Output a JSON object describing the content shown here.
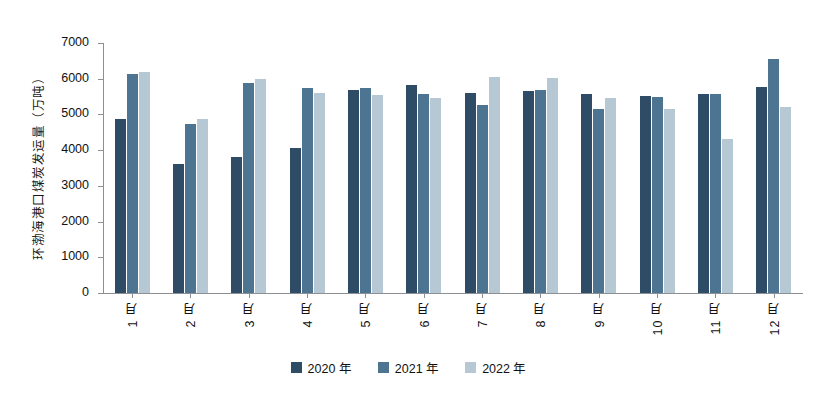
{
  "chart_data": {
    "type": "bar",
    "title": "",
    "xlabel": "",
    "ylabel": "环渤海港口煤炭发运量（万吨）",
    "ylim": [
      0,
      7000
    ],
    "yticks": [
      0,
      1000,
      2000,
      3000,
      4000,
      5000,
      6000,
      7000
    ],
    "ytick_labels": [
      "0",
      "1000",
      "2000",
      "3000",
      "4000",
      "5000",
      "6000",
      "7000"
    ],
    "grid": false,
    "legend_position": "bottom",
    "categories": [
      "1 月",
      "2 月",
      "3 月",
      "4 月",
      "5 月",
      "6 月",
      "7 月",
      "8 月",
      "9 月",
      "10 月",
      "11 月",
      "12 月"
    ],
    "series": [
      {
        "name": "2020 年",
        "color": "#2f4c66",
        "values": [
          4860,
          3600,
          3810,
          4070,
          5690,
          5830,
          5610,
          5650,
          5560,
          5520,
          5580,
          5770
        ]
      },
      {
        "name": "2021 年",
        "color": "#4d7490",
        "values": [
          6140,
          4720,
          5890,
          5750,
          5750,
          5570,
          5260,
          5690,
          5150,
          5500,
          5580,
          6540
        ]
      },
      {
        "name": "2022 年",
        "color": "#b7c8d5",
        "values": [
          6180,
          4860,
          6000,
          5610,
          5540,
          5470,
          6040,
          6030,
          5460,
          5150,
          4320,
          5210
        ]
      }
    ]
  },
  "axis": {
    "y_title": "环渤海港口煤炭发运量（万吨）"
  }
}
